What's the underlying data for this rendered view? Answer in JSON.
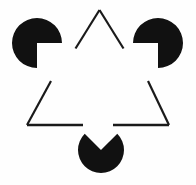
{
  "figure": {
    "name": "Kanizsa triangle illusion",
    "canvas": {
      "width": 196,
      "height": 185
    },
    "background_color": "#fefefe",
    "ink_color": "#111111",
    "stroke_color": "#1a1a1a",
    "stroke_width": 2.2,
    "visible_text": "",
    "inducers": [
      {
        "id": "top-left-disc",
        "label": "top-left pac-man inducer",
        "cx": 37.0,
        "cy": 43.0,
        "r": 25.0,
        "wedge_start_deg": 0,
        "wedge_end_deg": 90,
        "wedge_opens_toward": "lower-right",
        "fill": "#111111"
      },
      {
        "id": "top-right-disc",
        "label": "top-right pac-man inducer",
        "cx": 158.0,
        "cy": 43.0,
        "r": 25.0,
        "wedge_start_deg": 90,
        "wedge_end_deg": 180,
        "wedge_opens_toward": "lower-left",
        "fill": "#111111"
      },
      {
        "id": "bottom-disc",
        "label": "bottom pac-man inducer",
        "cx": 101.0,
        "cy": 150.0,
        "r": 23.0,
        "wedge_start_deg": 225,
        "wedge_end_deg": 315,
        "wedge_opens_toward": "up",
        "fill": "#111111"
      }
    ],
    "outline_triangle": {
      "id": "outlined-triangle",
      "label": "outlined triangle with interrupted edges",
      "apex": {
        "x": 99.5,
        "y": 10.0
      },
      "bottom_left": {
        "x": 27.0,
        "y": 125.0
      },
      "bottom_right": {
        "x": 169.0,
        "y": 125.0
      },
      "segments": [
        {
          "id": "apex-left-segment",
          "d": "M 99.5 10 L 75.5 48.5"
        },
        {
          "id": "apex-right-segment",
          "d": "M 99.5 10 L 123.5 48.5"
        },
        {
          "id": "left-lower-segment",
          "d": "M 51.0 81.0 L 27.0 125.0"
        },
        {
          "id": "right-lower-segment",
          "d": "M 148.0 81.0 L 169.0 125.0"
        },
        {
          "id": "base-left-segment",
          "d": "M 27.0 125.0 L 83.0 125.0"
        },
        {
          "id": "base-right-segment",
          "d": "M 113.0 125.0 L 169.0 125.0"
        }
      ]
    }
  }
}
